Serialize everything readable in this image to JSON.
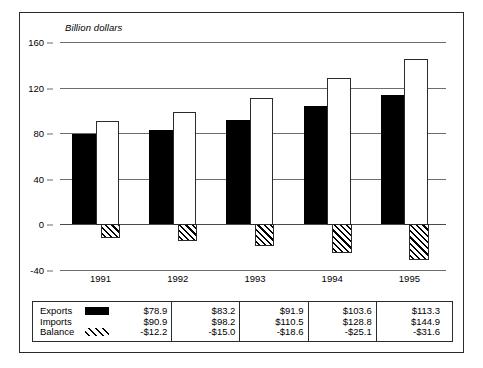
{
  "chart_data": {
    "type": "bar",
    "title": "",
    "ylabel": "Billion dollars",
    "xlabel": "",
    "categories": [
      "1991",
      "1992",
      "1993",
      "1994",
      "1995"
    ],
    "series": [
      {
        "name": "Exports",
        "swatch": "black",
        "values": [
          78.9,
          83.2,
          91.9,
          103.6,
          113.3
        ],
        "labels": [
          "$78.9",
          "$83.2",
          "$91.9",
          "$103.6",
          "$113.3"
        ]
      },
      {
        "name": "Imports",
        "swatch": "white",
        "values": [
          90.9,
          98.2,
          110.5,
          128.8,
          144.9
        ],
        "labels": [
          "$90.9",
          "$98.2",
          "$110.5",
          "$128.8",
          "$144.9"
        ]
      },
      {
        "name": "Balance",
        "swatch": "hatched",
        "values": [
          -12.2,
          -15.0,
          -18.6,
          -25.1,
          -31.6
        ],
        "labels": [
          "-$12.2",
          "-$15.0",
          "-$18.6",
          "-$25.1",
          "-$31.6"
        ]
      }
    ],
    "ylim": [
      -40,
      160
    ],
    "yticks": [
      160,
      120,
      80,
      40,
      0,
      -40
    ],
    "ytick_labels": [
      "160",
      "120",
      "80",
      "40",
      "0",
      "-40"
    ],
    "grid": true,
    "legend_position": "bottom-table",
    "colors": {
      "exports": "#000000",
      "imports": "#ffffff",
      "balance_hatch": "#000000",
      "axis": "#6d6d6d",
      "frame": "#2b2b2b"
    }
  }
}
